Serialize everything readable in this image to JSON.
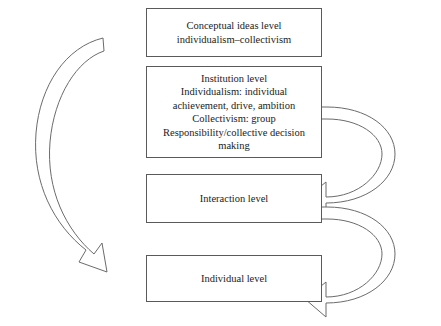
{
  "diagram": {
    "background_color": "#ffffff",
    "line_color": "#6b6b6b",
    "box_border_color": "#5a5a5a",
    "text_color": "#1b1b1b",
    "boxes": [
      {
        "id": "conceptual",
        "name": "conceptual-ideas-level-box",
        "text": "Conceptual ideas level\nindividualism–collectivism"
      },
      {
        "id": "institution",
        "name": "institution-level-box",
        "text": "Institution level\nIndividualism: individual\nachievement, drive, ambition\nCollectivism: group\nResponsibility/collective decision\nmaking"
      },
      {
        "id": "interaction",
        "name": "interaction-level-box",
        "text": "Interaction level"
      },
      {
        "id": "individual",
        "name": "individual-level-box",
        "text": "Individual level"
      }
    ],
    "arrows": [
      {
        "id": "downward-arc",
        "name": "downward-curved-arrow",
        "direction": "top-to-bottom",
        "side": "left",
        "label": ""
      },
      {
        "id": "feedback-upper",
        "name": "upper-feedback-arrow",
        "direction": "interaction-to-institution",
        "side": "right",
        "label": ""
      },
      {
        "id": "feedback-lower",
        "name": "lower-feedback-arrow",
        "direction": "individual-to-interaction",
        "side": "right",
        "label": ""
      }
    ]
  }
}
